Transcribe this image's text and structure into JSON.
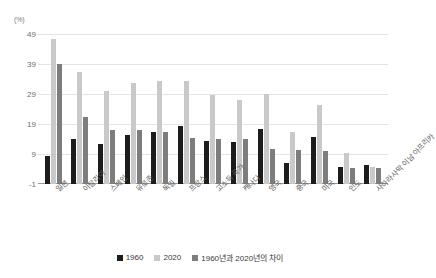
{
  "chart_data": {
    "type": "bar",
    "title": "",
    "subtitle": "",
    "xlabel": "",
    "ylabel": "(%)",
    "unit_label": "(%)",
    "ylim": [
      -1,
      49
    ],
    "yticks": [
      49,
      39,
      29,
      19,
      9,
      -1
    ],
    "grid": true,
    "legend_position": "bottom",
    "categories": [
      "일본",
      "이탈리아",
      "스페인",
      "유로존",
      "독일",
      "프랑스",
      "고소득 국가",
      "캐나다",
      "영국",
      "중국",
      "미국",
      "인도",
      "사하라사막 이남 아프리카"
    ],
    "series": [
      {
        "name": "1960",
        "color": "#1c1c1c",
        "values": [
          8.5,
          14.0,
          12.3,
          15.3,
          16.5,
          18.5,
          13.3,
          13.0,
          17.5,
          6.0,
          14.8,
          4.8,
          5.2
        ]
      },
      {
        "name": "2020",
        "color": "#c9c9c9",
        "values": [
          47.5,
          36.5,
          30.0,
          32.8,
          33.5,
          33.5,
          28.8,
          27.0,
          29.0,
          16.5,
          25.5,
          9.3,
          4.8
        ]
      },
      {
        "name": "1960년과 2020년의 차이",
        "color": "#7d7d7d",
        "values": [
          39.0,
          21.5,
          17.0,
          17.0,
          16.2,
          14.3,
          14.0,
          14.0,
          10.8,
          10.2,
          10.0,
          4.3,
          4.5
        ]
      }
    ]
  },
  "legend": {
    "items": [
      {
        "label": "1960",
        "key": "s1960"
      },
      {
        "label": "2020",
        "key": "s2020"
      },
      {
        "label": "1960년과 2020년의 차이",
        "key": "sdiff"
      }
    ]
  }
}
